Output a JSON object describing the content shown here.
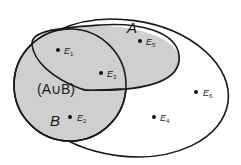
{
  "diagram": {
    "type": "venn",
    "colors": {
      "background": "#ffffff",
      "shaded_fill": "#cfcfcf",
      "stroke": "#1a1a1a",
      "point": "#111111"
    },
    "sets": {
      "A": {
        "label": "A"
      },
      "B": {
        "label": "B"
      },
      "union": {
        "label": "(A∪B)"
      }
    },
    "points": [
      {
        "id": "E1",
        "letter": "E",
        "sub": "1"
      },
      {
        "id": "E2",
        "letter": "E",
        "sub": "2"
      },
      {
        "id": "E3",
        "letter": "E",
        "sub": "3"
      },
      {
        "id": "E4",
        "letter": "E",
        "sub": "4"
      },
      {
        "id": "E5",
        "letter": "E",
        "sub": "5"
      },
      {
        "id": "E6",
        "letter": "E",
        "sub": "6"
      }
    ]
  }
}
